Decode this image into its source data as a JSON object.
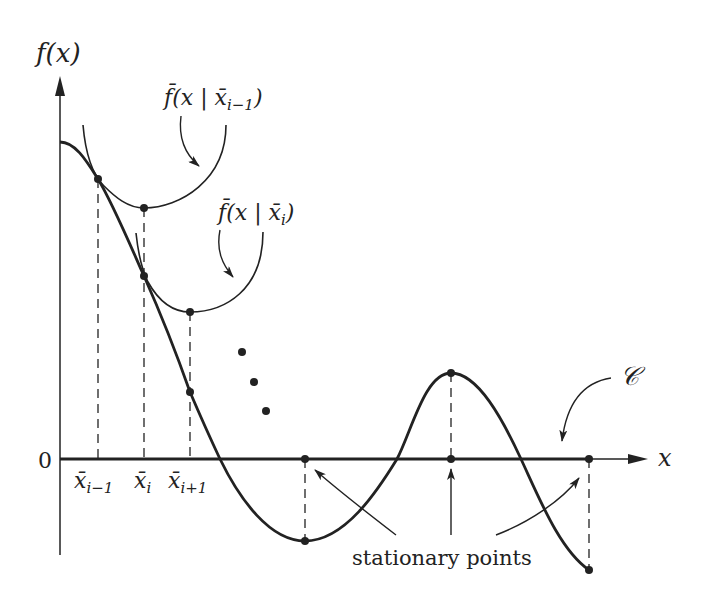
{
  "diagram": {
    "axes": {
      "y_label": "f(x)",
      "x_label": "x",
      "origin_label": "0"
    },
    "x_ticks": [
      {
        "label": "x̄",
        "sub": "i−1"
      },
      {
        "label": "x̄",
        "sub": "i"
      },
      {
        "label": "x̄",
        "sub": "i+1"
      }
    ],
    "approximations": [
      {
        "label": "f̄(x | x̄",
        "sub": "i−1",
        "close": ")"
      },
      {
        "label": "f̄(x | x̄",
        "sub": "i",
        "close": ")"
      }
    ],
    "curve_label": "𝒞",
    "annotation": "stationary points",
    "colors": {
      "stroke": "#222222",
      "background": "#ffffff"
    }
  }
}
